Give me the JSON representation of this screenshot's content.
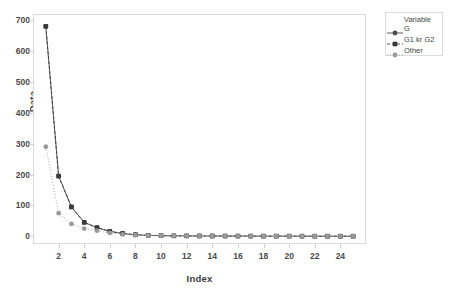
{
  "chart_data": {
    "type": "line",
    "title": "",
    "xlabel": "Index",
    "ylabel": "Data",
    "xlim": [
      0.0,
      26.0
    ],
    "ylim": [
      -25,
      720
    ],
    "grid": false,
    "legend_position": "right-outside",
    "legend_title": "Variable",
    "yticks": [
      0,
      100,
      200,
      300,
      400,
      500,
      600,
      700
    ],
    "xticks": [
      2,
      4,
      6,
      8,
      10,
      12,
      14,
      16,
      18,
      20,
      22,
      24
    ],
    "x": [
      1,
      2,
      3,
      4,
      5,
      6,
      7,
      8,
      9,
      10,
      11,
      12,
      13,
      14,
      15,
      16,
      17,
      18,
      19,
      20,
      21,
      22,
      23,
      24,
      25
    ],
    "series": [
      {
        "name": "G",
        "marker": "circle",
        "linestyle": "solid",
        "color": "#4a4a4a",
        "values": [
          680,
          195,
          95,
          45,
          28,
          16,
          9,
          5,
          3,
          2,
          1.5,
          1.2,
          1.0,
          0.9,
          0.8,
          0.7,
          0.6,
          0.5,
          0.5,
          0.4,
          0.4,
          0.3,
          0.3,
          0.2,
          0.2
        ]
      },
      {
        "name": "G1 kr G2",
        "marker": "square",
        "linestyle": "dashed",
        "color": "#3a3a3a",
        "values": [
          680,
          195,
          95,
          45,
          28,
          16,
          9,
          5,
          3,
          2,
          1.5,
          1.2,
          1.0,
          0.9,
          0.8,
          0.7,
          0.6,
          0.5,
          0.5,
          0.4,
          0.4,
          0.3,
          0.3,
          0.2,
          0.2
        ]
      },
      {
        "name": "Other",
        "marker": "circle",
        "linestyle": "dotted",
        "color": "#9a9a9a",
        "values": [
          290,
          75,
          40,
          25,
          18,
          11,
          6,
          4,
          2.5,
          1.8,
          1.4,
          1.1,
          0.9,
          0.8,
          0.7,
          0.6,
          0.5,
          0.5,
          0.4,
          0.4,
          0.3,
          0.3,
          0.2,
          0.2,
          0.2
        ]
      }
    ]
  },
  "legend": {
    "title": "Variable",
    "entries": [
      {
        "label": "G"
      },
      {
        "label": "G1 kr G2"
      },
      {
        "label": "Other"
      }
    ]
  },
  "axes": {
    "y_title": "Data",
    "x_title": "Index"
  },
  "colors": {
    "frame": "#d9d9d9",
    "tick_text": "#4a4a4a",
    "axis_title": "#3b3b3b",
    "series_dark": "#4a4a4a",
    "series_light": "#9a9a9a",
    "background": "#ffffff"
  }
}
